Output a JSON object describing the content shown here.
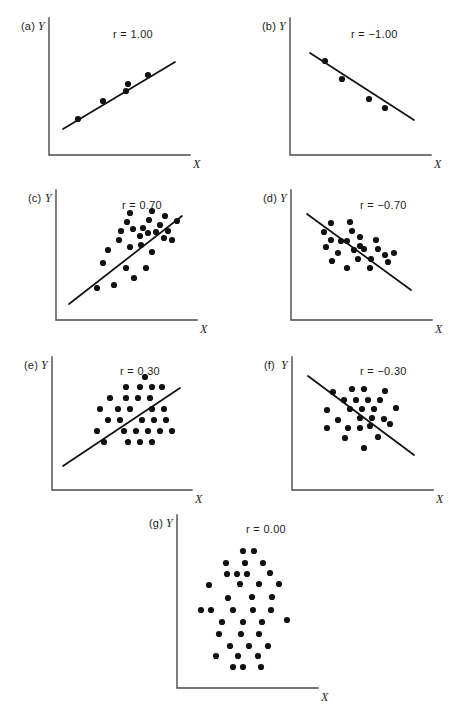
{
  "figure": {
    "title": "",
    "width": 449,
    "height": 714,
    "background": "#ffffff",
    "ink_color": "#111111",
    "axis_color": "#4a4a4a"
  },
  "chart_data": {
    "type": "scatter",
    "title": "",
    "xlabel": "X",
    "ylabel": "Y",
    "grid": false,
    "legend": "none",
    "panels": [
      {
        "id": "a",
        "label": "(a)",
        "r_label": "r = 1.00",
        "r_value": 1.0,
        "xlabel": "X",
        "ylabel": "Y",
        "axis": {
          "x": 49,
          "y_top": 18,
          "y_bottom": 155,
          "x_right": 190
        },
        "r_label_pos": {
          "x": 113,
          "y": 28
        },
        "fit_line": {
          "x1": 63,
          "y1": 129,
          "x2": 175,
          "y2": 62
        },
        "points": [
          [
            78,
            119
          ],
          [
            103,
            101
          ],
          [
            126,
            91
          ],
          [
            128,
            84
          ],
          [
            148,
            75
          ]
        ]
      },
      {
        "id": "b",
        "label": "(b)",
        "r_label": "r = −1.00",
        "r_value": -1.0,
        "xlabel": "X",
        "ylabel": "Y",
        "axis": {
          "x": 290,
          "y_top": 18,
          "y_bottom": 155,
          "x_right": 431
        },
        "r_label_pos": {
          "x": 351,
          "y": 28
        },
        "fit_line": {
          "x1": 310,
          "y1": 53,
          "x2": 414,
          "y2": 120
        },
        "points": [
          [
            325,
            61
          ],
          [
            342,
            79
          ],
          [
            369,
            99
          ],
          [
            385,
            108
          ]
        ]
      },
      {
        "id": "c",
        "label": "(c)",
        "r_label": "r = 0.70",
        "r_value": 0.7,
        "xlabel": "X",
        "ylabel": "Y",
        "axis": {
          "x": 56,
          "y_top": 190,
          "y_bottom": 320,
          "x_right": 197
        },
        "r_label_pos": {
          "x": 122,
          "y": 199
        },
        "fit_line": {
          "x1": 69,
          "y1": 304,
          "x2": 182,
          "y2": 216
        },
        "points": [
          [
            97,
            288
          ],
          [
            114,
            285
          ],
          [
            134,
            278
          ],
          [
            103,
            263
          ],
          [
            126,
            268
          ],
          [
            146,
            268
          ],
          [
            108,
            250
          ],
          [
            130,
            247
          ],
          [
            141,
            245
          ],
          [
            152,
            252
          ],
          [
            119,
            240
          ],
          [
            140,
            236
          ],
          [
            148,
            233
          ],
          [
            156,
            232
          ],
          [
            121,
            231
          ],
          [
            133,
            229
          ],
          [
            143,
            228
          ],
          [
            160,
            225
          ],
          [
            127,
            222
          ],
          [
            149,
            220
          ],
          [
            168,
            231
          ],
          [
            164,
            238
          ],
          [
            172,
            240
          ],
          [
            130,
            213
          ],
          [
            152,
            211
          ],
          [
            165,
            216
          ],
          [
            177,
            221
          ]
        ]
      },
      {
        "id": "d",
        "label": "(d)",
        "r_label": "r = −0.70",
        "r_value": -0.7,
        "xlabel": "X",
        "ylabel": "Y",
        "axis": {
          "x": 291,
          "y_top": 190,
          "y_bottom": 320,
          "x_right": 432
        },
        "r_label_pos": {
          "x": 360,
          "y": 199
        },
        "fit_line": {
          "x1": 307,
          "y1": 214,
          "x2": 411,
          "y2": 290
        },
        "points": [
          [
            331,
            223
          ],
          [
            350,
            222
          ],
          [
            324,
            232
          ],
          [
            331,
            240
          ],
          [
            341,
            241
          ],
          [
            347,
            241
          ],
          [
            360,
            237
          ],
          [
            326,
            247
          ],
          [
            338,
            253
          ],
          [
            354,
            250
          ],
          [
            364,
            249
          ],
          [
            376,
            240
          ],
          [
            378,
            249
          ],
          [
            332,
            261
          ],
          [
            358,
            259
          ],
          [
            371,
            259
          ],
          [
            385,
            255
          ],
          [
            347,
            268
          ],
          [
            370,
            268
          ],
          [
            388,
            262
          ],
          [
            394,
            253
          ],
          [
            360,
            246
          ],
          [
            352,
            231
          ]
        ]
      },
      {
        "id": "e",
        "label": "(e)",
        "r_label": "r = 0.30",
        "r_value": 0.3,
        "xlabel": "X",
        "ylabel": "Y",
        "axis": {
          "x": 52,
          "y_top": 357,
          "y_bottom": 490,
          "x_right": 192
        },
        "r_label_pos": {
          "x": 120,
          "y": 365
        },
        "fit_line": {
          "x1": 63,
          "y1": 466,
          "x2": 180,
          "y2": 388
        },
        "points": [
          [
            104,
            442
          ],
          [
            128,
            442
          ],
          [
            140,
            442
          ],
          [
            152,
            442
          ],
          [
            97,
            431
          ],
          [
            124,
            431
          ],
          [
            136,
            431
          ],
          [
            148,
            431
          ],
          [
            160,
            431
          ],
          [
            172,
            431
          ],
          [
            108,
            420
          ],
          [
            120,
            420
          ],
          [
            142,
            420
          ],
          [
            154,
            420
          ],
          [
            166,
            420
          ],
          [
            100,
            409
          ],
          [
            118,
            409
          ],
          [
            130,
            409
          ],
          [
            152,
            409
          ],
          [
            164,
            409
          ],
          [
            110,
            398
          ],
          [
            126,
            398
          ],
          [
            138,
            398
          ],
          [
            150,
            398
          ],
          [
            126,
            387
          ],
          [
            140,
            387
          ],
          [
            152,
            387
          ],
          [
            162,
            387
          ],
          [
            145,
            377
          ]
        ]
      },
      {
        "id": "f",
        "label": "(f)",
        "r_label": "r = −0.30",
        "r_value": -0.3,
        "xlabel": "X",
        "ylabel": "Y",
        "axis": {
          "x": 292,
          "y_top": 357,
          "y_bottom": 490,
          "x_right": 433
        },
        "r_label_pos": {
          "x": 360,
          "y": 365
        },
        "fit_line": {
          "x1": 308,
          "y1": 376,
          "x2": 414,
          "y2": 455
        },
        "points": [
          [
            333,
            392
          ],
          [
            352,
            389
          ],
          [
            364,
            389
          ],
          [
            385,
            391
          ],
          [
            344,
            400
          ],
          [
            356,
            400
          ],
          [
            368,
            400
          ],
          [
            380,
            400
          ],
          [
            327,
            410
          ],
          [
            350,
            409
          ],
          [
            362,
            409
          ],
          [
            374,
            409
          ],
          [
            396,
            408
          ],
          [
            338,
            420
          ],
          [
            360,
            418
          ],
          [
            372,
            418
          ],
          [
            384,
            419
          ],
          [
            327,
            428
          ],
          [
            348,
            428
          ],
          [
            360,
            428
          ],
          [
            370,
            426
          ],
          [
            390,
            424
          ],
          [
            345,
            438
          ],
          [
            378,
            437
          ],
          [
            364,
            448
          ]
        ]
      },
      {
        "id": "g",
        "label": "(g)",
        "r_label": "r = 0.00",
        "r_value": 0.0,
        "xlabel": "X",
        "ylabel": "Y",
        "axis": {
          "x": 177,
          "y_top": 515,
          "y_bottom": 688,
          "x_right": 318
        },
        "r_label_pos": {
          "x": 246,
          "y": 523
        },
        "fit_line": null,
        "points": [
          [
            243,
            551
          ],
          [
            254,
            551
          ],
          [
            226,
            563
          ],
          [
            245,
            563
          ],
          [
            263,
            563
          ],
          [
            227,
            574
          ],
          [
            237,
            574
          ],
          [
            247,
            574
          ],
          [
            270,
            573
          ],
          [
            209,
            585
          ],
          [
            240,
            584
          ],
          [
            259,
            584
          ],
          [
            279,
            584
          ],
          [
            228,
            598
          ],
          [
            252,
            597
          ],
          [
            272,
            597
          ],
          [
            201,
            610
          ],
          [
            211,
            610
          ],
          [
            233,
            610
          ],
          [
            253,
            610
          ],
          [
            271,
            610
          ],
          [
            222,
            622
          ],
          [
            243,
            622
          ],
          [
            262,
            622
          ],
          [
            287,
            620
          ],
          [
            219,
            634
          ],
          [
            241,
            634
          ],
          [
            259,
            634
          ],
          [
            230,
            646
          ],
          [
            249,
            646
          ],
          [
            268,
            646
          ],
          [
            216,
            656
          ],
          [
            238,
            656
          ],
          [
            258,
            656
          ],
          [
            233,
            667
          ],
          [
            243,
            667
          ],
          [
            261,
            667
          ]
        ]
      }
    ]
  }
}
